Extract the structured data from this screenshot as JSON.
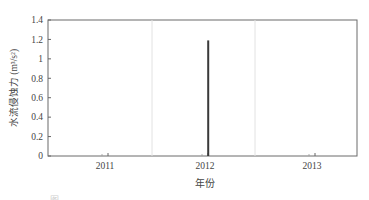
{
  "chart_data": {
    "type": "bar",
    "title": "",
    "xlabel": "年份",
    "ylabel": "水流侵蚀力 (m³/s²)",
    "categories": [
      "2011",
      "2012",
      "2013"
    ],
    "series": [
      {
        "name": "水流侵蚀力",
        "x": [
          2012.03
        ],
        "values": [
          1.19
        ]
      }
    ],
    "ylim": [
      0,
      1.4
    ],
    "yticks": [
      "0",
      "0.2",
      "0.4",
      "0.6",
      "0.8",
      "1",
      "1.2",
      "1.4"
    ],
    "xticks": [
      "2011",
      "2012",
      "2013"
    ],
    "grid": {
      "vertical_separators": true,
      "horizontal": false
    },
    "legend": null,
    "colors": {
      "bar": "#3a3a3a",
      "axis": "#555555",
      "separator": "#e2e2e2"
    }
  },
  "caption": {
    "prefix": "图"
  }
}
